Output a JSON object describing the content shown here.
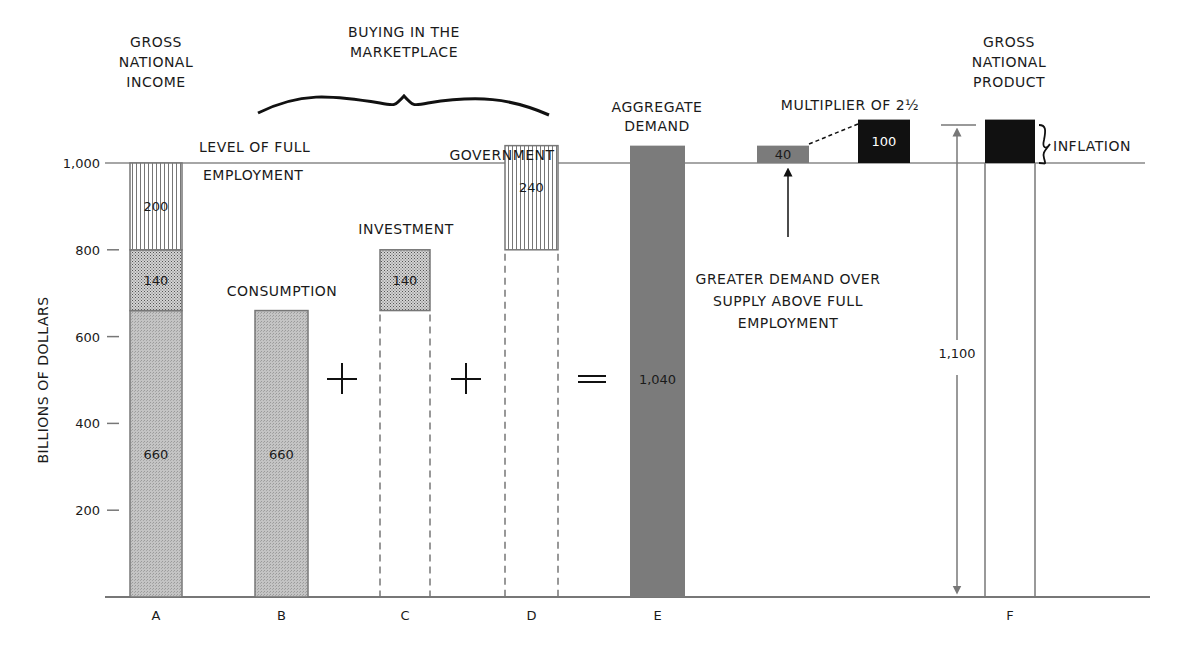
{
  "chart_data": {
    "type": "bar",
    "title": "",
    "ylabel": "BILLIONS OF DOLLARS",
    "xlabel": "",
    "ylim": [
      0,
      1000
    ],
    "y_ticks": [
      {
        "value": 200,
        "label": "200"
      },
      {
        "value": 400,
        "label": "400"
      },
      {
        "value": 600,
        "label": "600"
      },
      {
        "value": 800,
        "label": "800"
      },
      {
        "value": 1000,
        "label": "1,000"
      }
    ],
    "categories": [
      "A",
      "B",
      "C",
      "D",
      "E",
      "F"
    ],
    "bars": {
      "A": {
        "title": [
          "GROSS",
          "NATIONAL",
          "INCOME"
        ],
        "segments": [
          {
            "name": "consumption",
            "value": 660,
            "label": "660",
            "pattern": "stipple"
          },
          {
            "name": "investment",
            "value": 140,
            "label": "140",
            "pattern": "crosshatch"
          },
          {
            "name": "government",
            "value": 200,
            "label": "200",
            "pattern": "vertical-lines"
          }
        ]
      },
      "B": {
        "title": [
          "CONSUMPTION"
        ],
        "base": 0,
        "value": 660,
        "label": "660",
        "pattern": "stipple"
      },
      "C": {
        "title": [
          "INVESTMENT"
        ],
        "base": 660,
        "value": 140,
        "label": "140",
        "pattern": "crosshatch",
        "dashed_below": true
      },
      "D": {
        "title": [
          "GOVERNMENT"
        ],
        "base": 800,
        "value": 240,
        "label": "240",
        "pattern": "vertical-lines",
        "dashed_below": true
      },
      "E": {
        "title": [
          "AGGREGATE",
          "DEMAND"
        ],
        "base": 0,
        "value": 1040,
        "label": "1,040",
        "pattern": "dark-gray"
      },
      "F": {
        "title": [
          "GROSS",
          "NATIONAL",
          "PRODUCT"
        ],
        "base": 0,
        "value": 1100,
        "label": "1,100",
        "inflation": 100
      }
    },
    "multiplier": {
      "title": "MULTIPLIER OF 2½",
      "excess_demand": 40,
      "excess_label": "40",
      "inflation_gap": 100,
      "inflation_label": "100"
    },
    "operators": [
      "+",
      "+",
      "="
    ],
    "annotations": {
      "full_employment": [
        "LEVEL OF FULL",
        "EMPLOYMENT"
      ],
      "marketplace": [
        "BUYING IN THE",
        "MARKETPLACE"
      ],
      "greater_demand": [
        "GREATER DEMAND OVER",
        "SUPPLY ABOVE FULL",
        "EMPLOYMENT"
      ],
      "inflation": "INFLATION"
    },
    "full_employment_level": 1000,
    "grid": false
  },
  "colors": {
    "stipple": "#bdbdbd",
    "crosshatch": "#a9a9a9",
    "dark_gray": "#7b7b7b",
    "black": "#111111",
    "line": "#777777"
  }
}
